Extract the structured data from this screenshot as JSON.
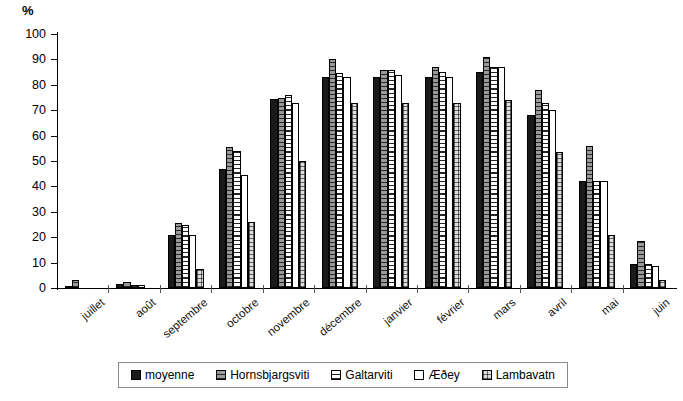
{
  "chart_data": {
    "type": "bar",
    "title": "",
    "subtitle": "",
    "xlabel": "",
    "ylabel": "%",
    "ylim": [
      0,
      100
    ],
    "ytick_step": 10,
    "grid": false,
    "legend_position": "bottom",
    "yticks": [
      "100",
      "90",
      "80",
      "70",
      "60",
      "50",
      "40",
      "30",
      "20",
      "10",
      "0"
    ],
    "categories": [
      "juillet",
      "août",
      "septembre",
      "octobre",
      "novembre",
      "décembre",
      "janvier",
      "février",
      "mars",
      "avril",
      "mai",
      "juin"
    ],
    "series": [
      {
        "name": "moyenne",
        "pattern": "solid-black",
        "color": "#1a1a1a",
        "values": [
          0.5,
          1.5,
          21,
          47,
          74.5,
          83,
          83,
          83,
          85,
          68,
          42,
          9.5
        ]
      },
      {
        "name": "Hornsbjargsviti",
        "pattern": "gray-hatch",
        "color": "#9a9a9a",
        "values": [
          3,
          2.5,
          25.5,
          55.5,
          75,
          90,
          86,
          87,
          91,
          78,
          56,
          18.5
        ]
      },
      {
        "name": "Galtarviti",
        "pattern": "horizontal-lines",
        "color": "#ffffff",
        "values": [
          0,
          1,
          25,
          54,
          76,
          84.5,
          86,
          85,
          87,
          73,
          42,
          9.5
        ]
      },
      {
        "name": "Æðey",
        "pattern": "white",
        "color": "#ffffff",
        "values": [
          0,
          1,
          21,
          44.5,
          73,
          83,
          84,
          83,
          87,
          70,
          42,
          8.5
        ]
      },
      {
        "name": "Lambavatn",
        "pattern": "checker",
        "color": "#dedede",
        "values": [
          0,
          0,
          7.5,
          26,
          50,
          73,
          73,
          73,
          74,
          53.5,
          21,
          3
        ]
      }
    ]
  }
}
